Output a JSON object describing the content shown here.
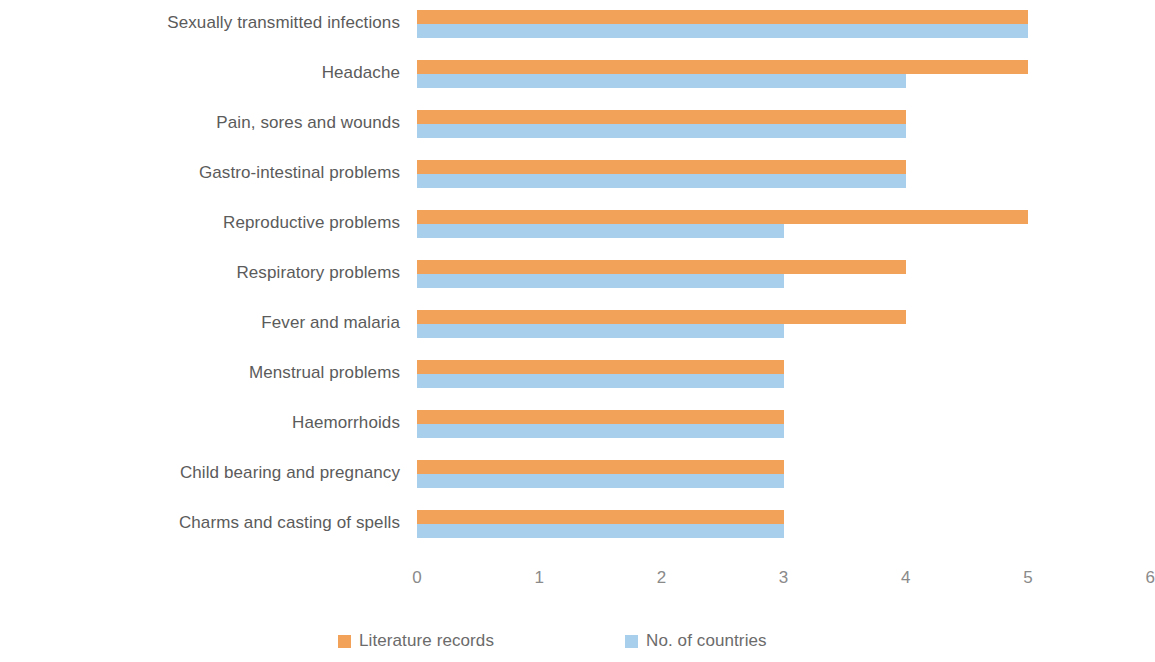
{
  "chart_data": {
    "type": "bar",
    "orientation": "horizontal",
    "title": "",
    "subtitle": "",
    "xlabel": "",
    "ylabel": "",
    "xlim": [
      0,
      6
    ],
    "xticks": [
      "0",
      "1",
      "2",
      "3",
      "4",
      "5",
      "6"
    ],
    "grid": false,
    "legend_position": "bottom",
    "categories": [
      "Sexually transmitted infections",
      "Headache",
      "Pain, sores and wounds",
      "Gastro-intestinal problems",
      "Reproductive problems",
      "Respiratory problems",
      "Fever and malaria",
      "Menstrual problems",
      "Haemorrhoids",
      "Child bearing and pregnancy",
      "Charms and casting of spells"
    ],
    "series": [
      {
        "name": "Literature records",
        "color": "#F2A359",
        "values": [
          5,
          5,
          4,
          4,
          5,
          4,
          4,
          3,
          3,
          3,
          3
        ]
      },
      {
        "name": "No. of countries",
        "color": "#A8D0ED",
        "values": [
          5,
          4,
          4,
          4,
          3,
          3,
          3,
          3,
          3,
          3,
          3
        ]
      }
    ]
  }
}
